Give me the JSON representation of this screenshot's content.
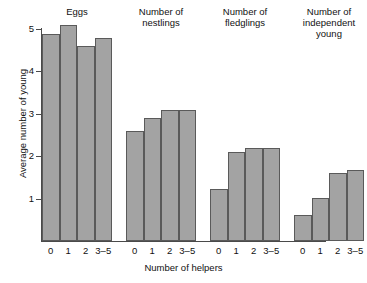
{
  "chart_data": {
    "type": "bar",
    "title": "",
    "xlabel": "Number of helpers",
    "ylabel": "Average number of young",
    "categories": [
      "0",
      "1",
      "2",
      "3–5"
    ],
    "ylim": [
      0,
      5.4
    ],
    "yticks": [
      1,
      2,
      3,
      4,
      5
    ],
    "ytick_labels": [
      "1",
      "2",
      "3",
      "4",
      "5"
    ],
    "grid": false,
    "legend": "none",
    "groups": [
      {
        "name": "Eggs",
        "title_lines": [
          "Eggs"
        ],
        "categories": [
          "0",
          "1",
          "2",
          "3–5"
        ],
        "values": [
          4.87,
          5.08,
          4.58,
          4.78
        ]
      },
      {
        "name": "Number of nestlings",
        "title_lines": [
          "Number of",
          "nestlings"
        ],
        "categories": [
          "0",
          "1",
          "2",
          "3–5"
        ],
        "values": [
          2.58,
          2.89,
          3.09,
          3.09
        ]
      },
      {
        "name": "Number of fledglings",
        "title_lines": [
          "Number of",
          "fledglings"
        ],
        "categories": [
          "0",
          "1",
          "2",
          "3–5"
        ],
        "values": [
          1.22,
          2.1,
          2.19,
          2.19
        ]
      },
      {
        "name": "Number of independent young",
        "title_lines": [
          "Number of",
          "independent",
          "young"
        ],
        "categories": [
          "0",
          "1",
          "2",
          "3–5"
        ],
        "values": [
          0.62,
          1.02,
          1.6,
          1.68
        ]
      }
    ],
    "colors": {
      "bar_fill": "#a3a3a3",
      "bar_stroke": "#5a5a5a",
      "axis": "#4a4a4a",
      "text": "#111111",
      "background": "#ffffff"
    }
  }
}
